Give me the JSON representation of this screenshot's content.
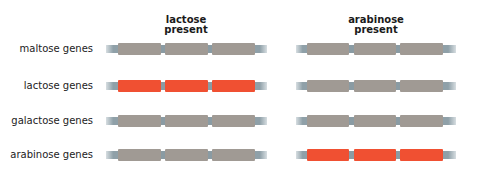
{
  "columns": [
    {
      "id": "lactose",
      "title_line1": "lactose",
      "title_line2": "present"
    },
    {
      "id": "arabinose",
      "title_line1": "arabinose",
      "title_line2": "present"
    }
  ],
  "rows": [
    {
      "label": "maltose genes",
      "expressed": {
        "lactose": false,
        "arabinose": false
      }
    },
    {
      "label": "lactose genes",
      "expressed": {
        "lactose": true,
        "arabinose": false
      }
    },
    {
      "label": "galactose genes",
      "expressed": {
        "lactose": false,
        "arabinose": false
      }
    },
    {
      "label": "arabinose genes",
      "expressed": {
        "lactose": false,
        "arabinose": true
      }
    }
  ],
  "colors": {
    "gene_off": "#a09a94",
    "gene_on": "#f05032",
    "stub": "#8fa0a8"
  }
}
